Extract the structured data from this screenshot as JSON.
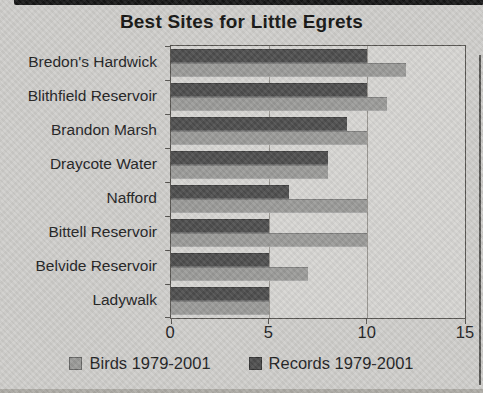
{
  "title": "Best Sites for Little Egrets",
  "colors": {
    "birds": "#9a9a98",
    "records": "#4d4d4d",
    "background": "#cfcecb",
    "plot_background": "#d6d5d2",
    "axis": "#55534f",
    "gridline": "#97948f",
    "text": "#21211f",
    "title_text": "#141412"
  },
  "chart_data": {
    "type": "bar",
    "orientation": "horizontal",
    "title": "Best Sites for Little Egrets",
    "categories": [
      "Bredon's Hardwick",
      "Blithfield Reservoir",
      "Brandon Marsh",
      "Draycote Water",
      "Nafford",
      "Bittell Reservoir",
      "Belvide Reservoir",
      "Ladywalk"
    ],
    "series": [
      {
        "name": "Birds 1979-2001",
        "color_key": "birds",
        "values": [
          12,
          11,
          10,
          8,
          10,
          10,
          7,
          5
        ]
      },
      {
        "name": "Records 1979-2001",
        "color_key": "records",
        "values": [
          10,
          10,
          9,
          8,
          6,
          5,
          5,
          5
        ]
      }
    ],
    "xlabel": "",
    "ylabel": "",
    "xlim": [
      0,
      15
    ],
    "xticks": [
      0,
      5,
      10,
      15
    ],
    "grid": "vertical-major",
    "legend_position": "bottom"
  }
}
